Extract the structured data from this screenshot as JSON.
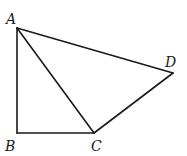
{
  "diagram": {
    "type": "geometry-figure",
    "points": {
      "A": {
        "label": "A",
        "x": 17,
        "y": 28,
        "label_x": 6,
        "label_y": 24
      },
      "B": {
        "label": "B",
        "x": 17,
        "y": 133,
        "label_x": 5,
        "label_y": 151
      },
      "C": {
        "label": "C",
        "x": 94,
        "y": 133,
        "label_x": 91,
        "label_y": 151
      },
      "D": {
        "label": "D",
        "x": 173,
        "y": 73,
        "label_x": 165,
        "label_y": 67
      }
    },
    "segments": [
      {
        "from": "A",
        "to": "B"
      },
      {
        "from": "B",
        "to": "C"
      },
      {
        "from": "A",
        "to": "C"
      },
      {
        "from": "C",
        "to": "D"
      },
      {
        "from": "A",
        "to": "D"
      }
    ],
    "stroke_color": "#1a1a1a",
    "background": "#ffffff"
  }
}
